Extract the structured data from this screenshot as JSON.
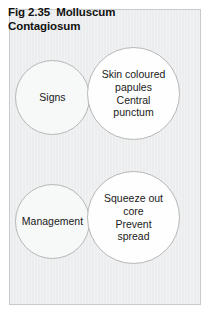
{
  "figure": {
    "title": "Fig 2.35  Molluscum\nContagiosum",
    "panel_background": "#ecedee",
    "panel_border": "#c9cacb",
    "circle_stroke": "#b6b7b8",
    "text_color": "#1a1a1a"
  },
  "diagram_data": {
    "type": "venn",
    "groups": [
      {
        "id": "signs",
        "left_circle": {
          "label": "Signs",
          "fill": "#f7f8f8"
        },
        "right_circle": {
          "label": "Skin coloured\npapules\nCentral\npunctum",
          "fill": "#fefefe"
        }
      },
      {
        "id": "management",
        "left_circle": {
          "label": "Management",
          "fill": "#f7f8f8"
        },
        "right_circle": {
          "label": "Squeeze out\ncore\nPrevent\nspread",
          "fill": "#fefefe"
        }
      }
    ]
  }
}
